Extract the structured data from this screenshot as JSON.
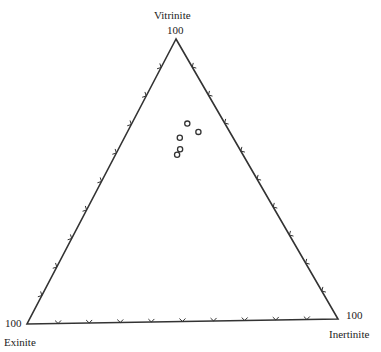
{
  "diagram": {
    "type": "ternary",
    "vertices": {
      "top": {
        "name": "Vitrinite",
        "value": "100"
      },
      "left": {
        "name": "Exinite",
        "value": "100"
      },
      "right": {
        "name": "Inertinite",
        "value": "100"
      }
    },
    "tick_interval_percent": 10
  },
  "chart_data": {
    "type": "scatter",
    "subtype": "ternary",
    "axes": [
      "Vitrinite",
      "Exinite",
      "Inertinite"
    ],
    "tick_interval": 10,
    "grid": false,
    "points": [
      {
        "Vitrinite": 70,
        "Inertinite": 18,
        "Exinite": 12
      },
      {
        "Vitrinite": 67,
        "Inertinite": 23,
        "Exinite": 10
      },
      {
        "Vitrinite": 65,
        "Inertinite": 18,
        "Exinite": 17
      },
      {
        "Vitrinite": 61,
        "Inertinite": 20,
        "Exinite": 19
      },
      {
        "Vitrinite": 59,
        "Inertinite": 20,
        "Exinite": 21
      }
    ],
    "marker": "open-circle"
  }
}
